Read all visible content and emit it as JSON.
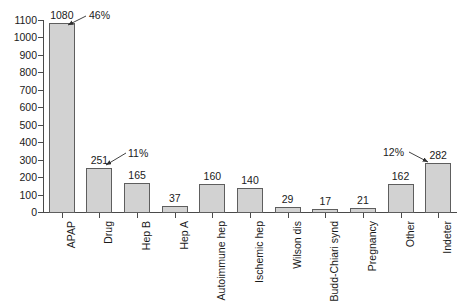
{
  "chart_data": {
    "type": "bar",
    "title": "",
    "subtitle": "",
    "xlabel": "",
    "ylabel": "",
    "ylim": [
      0,
      1100
    ],
    "ytick_step": 100,
    "grid": false,
    "legend": "none",
    "categories": [
      "APAP",
      "Drug",
      "Hep B",
      "Hep A",
      "Autoimmune hep",
      "Ischemic hep",
      "Wilson dis",
      "Budd-Chiari synd",
      "Pregnancy",
      "Other",
      "Indeter"
    ],
    "values": [
      1080,
      251,
      165,
      37,
      160,
      140,
      29,
      17,
      21,
      162,
      282
    ],
    "data_labels": [
      "1080",
      "251",
      "165",
      "37",
      "160",
      "140",
      "29",
      "17",
      "21",
      "162",
      "282"
    ],
    "ytick_labels": [
      "0",
      "100",
      "200",
      "300",
      "400",
      "500",
      "600",
      "700",
      "800",
      "900",
      "1000",
      "1100"
    ],
    "ytick_values": [
      0,
      100,
      200,
      300,
      400,
      500,
      600,
      700,
      800,
      900,
      1000,
      1100
    ],
    "annotations": [
      {
        "text": "46%",
        "target_category": "APAP"
      },
      {
        "text": "11%",
        "target_category": "Drug"
      },
      {
        "text": "12%",
        "target_category": "Indeter"
      }
    ],
    "colors": {
      "bar_fill": "#d2d2d2",
      "bar_stroke": "#5e5e5e",
      "axis": "#4a4a4a",
      "text": "#1a1a1a",
      "background": "#ffffff"
    }
  }
}
